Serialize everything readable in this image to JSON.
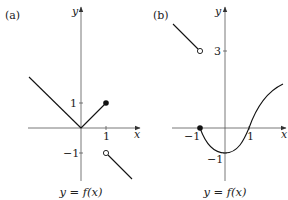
{
  "panels": [
    {
      "label": "(a)",
      "x_axis_label": "x",
      "y_axis_label": "y",
      "caption": "y = f(x)",
      "x_ticks": [
        {
          "value": 1,
          "label": "1"
        }
      ],
      "y_ticks": [
        {
          "value": 1,
          "label": "1"
        },
        {
          "value": -1,
          "label": "−1"
        }
      ],
      "pieces": [
        {
          "type": "line",
          "from": [
            -2.1,
            2.05
          ],
          "to": [
            0,
            0
          ]
        },
        {
          "type": "line",
          "from": [
            0,
            0
          ],
          "to": [
            1,
            1
          ]
        },
        {
          "type": "line",
          "from": [
            1,
            -1
          ],
          "to": [
            2.05,
            -2.05
          ]
        }
      ],
      "points": [
        {
          "at": [
            1,
            1
          ],
          "style": "closed"
        },
        {
          "at": [
            1,
            -1
          ],
          "style": "open"
        }
      ]
    },
    {
      "label": "(b)",
      "x_axis_label": "x",
      "y_axis_label": "y",
      "caption": "y = f(x)",
      "x_ticks": [
        {
          "value": -1,
          "label": "−1"
        },
        {
          "value": 1,
          "label": "1"
        }
      ],
      "y_ticks": [
        {
          "value": 3,
          "label": "3"
        },
        {
          "value": -1,
          "label": "−1"
        }
      ],
      "pieces": [
        {
          "type": "line",
          "from": [
            -2.1,
            4.1
          ],
          "to": [
            -1,
            3
          ]
        },
        {
          "type": "curve",
          "from": [
            -1,
            0
          ],
          "through": [
            [
              0,
              -1
            ],
            [
              1,
              0
            ]
          ],
          "to": [
            2.4,
            1.7
          ]
        }
      ],
      "points": [
        {
          "at": [
            -1,
            3
          ],
          "style": "open"
        },
        {
          "at": [
            -1,
            0
          ],
          "style": "closed"
        }
      ]
    }
  ]
}
